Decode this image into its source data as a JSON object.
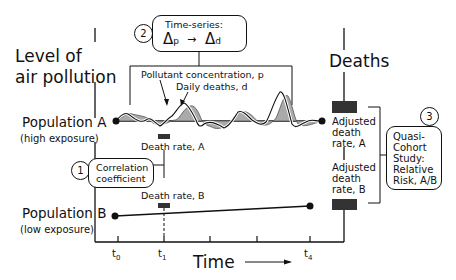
{
  "diagram": {
    "yaxis_label_line1": "Level of",
    "yaxis_label_line2": "air pollution",
    "deaths_label": "Deaths",
    "population_a": {
      "name": "Population A",
      "exposure": "(high exposure)"
    },
    "population_b": {
      "name": "Population B",
      "exposure": "(low exposure)"
    },
    "time_label": "Time",
    "ticks": [
      {
        "label": "t",
        "sub": "0"
      },
      {
        "label": "t",
        "sub": "1"
      },
      {
        "label": "t",
        "sub": "4"
      }
    ],
    "step1": {
      "number": "1",
      "line1": "Correlation",
      "line2": "coefficient"
    },
    "step2": {
      "number": "2",
      "title": "Time-series:",
      "delta": "Δ",
      "from_sub": "p",
      "to_sub": "d"
    },
    "step3": {
      "number": "3",
      "lines": [
        "Quasi-",
        "Cohort",
        "Study:",
        "Relative",
        "Risk, A/B"
      ]
    },
    "series_labels": {
      "pollutant": "Pollutant concentration, p",
      "deaths": "Daily deaths, d"
    },
    "death_rate_a": "Death rate, A",
    "death_rate_b": "Death rate, B",
    "adjusted_a": [
      "Adjusted",
      "death",
      "rate, A"
    ],
    "adjusted_b": [
      "Adjusted",
      "death",
      "rate, B"
    ]
  }
}
